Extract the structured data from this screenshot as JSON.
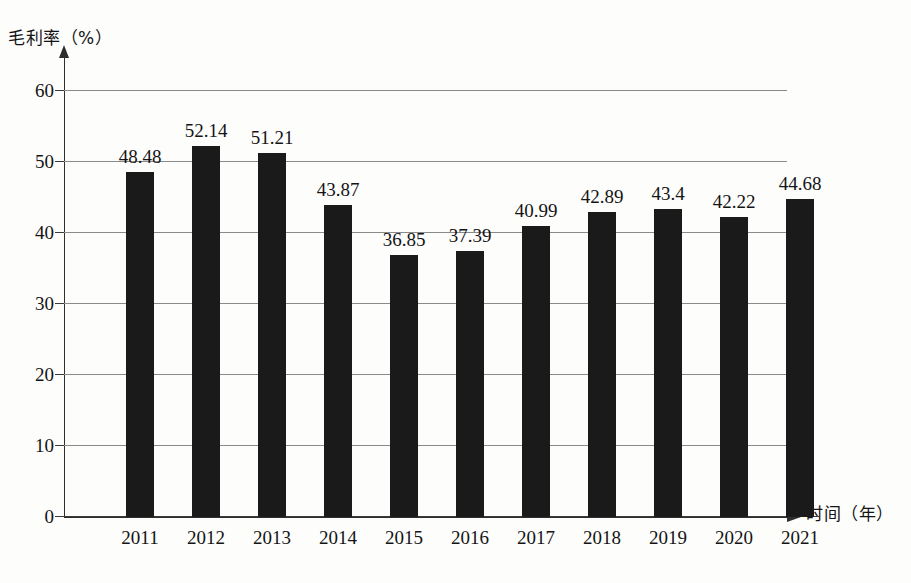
{
  "chart_data": {
    "type": "bar",
    "title": "",
    "xlabel": "时间（年）",
    "ylabel": "毛利率（%）",
    "categories": [
      "2011",
      "2012",
      "2013",
      "2014",
      "2015",
      "2016",
      "2017",
      "2018",
      "2019",
      "2020",
      "2021"
    ],
    "values": [
      48.48,
      52.14,
      51.21,
      43.87,
      36.85,
      37.39,
      40.99,
      42.89,
      43.4,
      42.22,
      44.68
    ],
    "value_labels": [
      "48.48",
      "52.14",
      "51.21",
      "43.87",
      "36.85",
      "37.39",
      "40.99",
      "42.89",
      "43.4",
      "42.22",
      "44.68"
    ],
    "ylim": [
      0,
      65
    ],
    "yticks": [
      0,
      10,
      20,
      30,
      40,
      50,
      60
    ],
    "ytick_labels": [
      "0",
      "10",
      "20",
      "30",
      "40",
      "50",
      "60"
    ],
    "grid": true,
    "legend": false,
    "bar_color": "#1a1a1a",
    "grid_color": "#8a8a8a",
    "axis_color": "#2e2e2e",
    "background_color": "#fdfdfc"
  }
}
